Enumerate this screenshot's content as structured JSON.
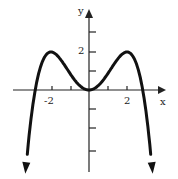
{
  "chart_data": {
    "type": "line",
    "title": "",
    "xlabel": "x",
    "ylabel": "y",
    "x_tick_labels": [
      "-2",
      "2"
    ],
    "y_tick_labels": [
      "2"
    ],
    "xlim": [
      -4.5,
      4.5
    ],
    "ylim": [
      -4,
      4
    ],
    "function": "y = -x^4/8 + x^2",
    "series": [
      {
        "name": "curve",
        "x": [
          -3.2,
          -2.83,
          -2,
          -1,
          0,
          1,
          2,
          2.83,
          3.2
        ],
        "y": [
          -2.87,
          0,
          2,
          0.875,
          0,
          0.875,
          2,
          0,
          -2.87
        ]
      }
    ],
    "grid": false,
    "legend": "none"
  },
  "labels": {
    "x": "x",
    "y": "y",
    "xneg2": "-2",
    "xpos2": "2",
    "y2": "2"
  }
}
